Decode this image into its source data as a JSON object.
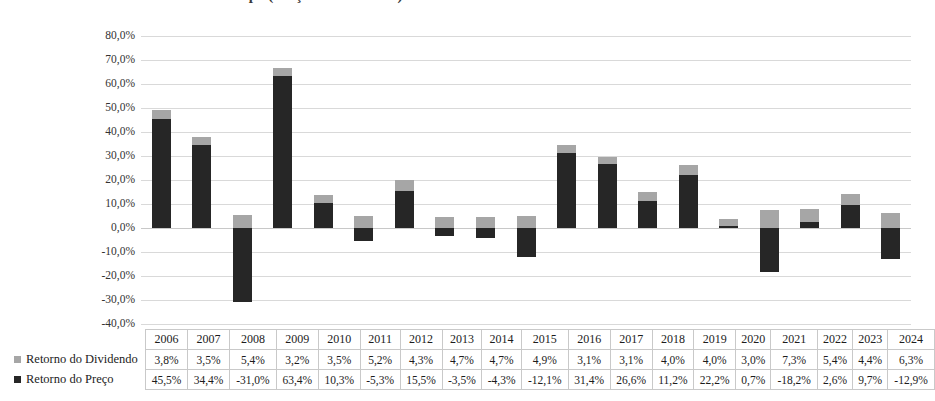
{
  "title": "Retorno Total do Ibovespa (Preço + Dividendos)",
  "legend": {
    "dividend_label": "Retorno do Dividendo",
    "price_label": "Retorno do Preço",
    "dividend_color": "#a6a6a6",
    "price_color": "#262626"
  },
  "axis": {
    "tick_labels": [
      "80,0%",
      "70,0%",
      "60,0%",
      "50,0%",
      "40,0%",
      "30,0%",
      "20,0%",
      "10,0%",
      "0,0%",
      "-10,0%",
      "-20,0%",
      "-30,0%",
      "-40,0%"
    ],
    "tick_values": [
      80,
      70,
      60,
      50,
      40,
      30,
      20,
      10,
      0,
      -10,
      -20,
      -30,
      -40
    ]
  },
  "table": {
    "year_header": [
      "2006",
      "2007",
      "2008",
      "2009",
      "2010",
      "2011",
      "2012",
      "2013",
      "2014",
      "2015",
      "2016",
      "2017",
      "2018",
      "2019",
      "2020",
      "2021",
      "2022",
      "2023",
      "2024"
    ],
    "dividend_row": [
      "3,8%",
      "3,5%",
      "5,4%",
      "3,2%",
      "3,5%",
      "5,2%",
      "4,3%",
      "4,7%",
      "4,7%",
      "4,9%",
      "3,1%",
      "3,1%",
      "4,0%",
      "4,0%",
      "3,0%",
      "7,3%",
      "5,4%",
      "4,4%",
      "6,3%"
    ],
    "price_row": [
      "45,5%",
      "34,4%",
      "-31,0%",
      "63,4%",
      "10,3%",
      "-5,3%",
      "15,5%",
      "-3,5%",
      "-4,3%",
      "-12,1%",
      "31,4%",
      "26,6%",
      "11,2%",
      "22,2%",
      "0,7%",
      "-18,2%",
      "2,6%",
      "9,7%",
      "-12,9%"
    ]
  },
  "chart_data": {
    "type": "bar",
    "stacked": true,
    "title": "Retorno Total do Ibovespa (Preço + Dividendos)",
    "xlabel": "",
    "ylabel": "",
    "ylim": [
      -40,
      80
    ],
    "ytick_step": 10,
    "grid": true,
    "legend_position": "table-row-headers",
    "categories": [
      "2006",
      "2007",
      "2008",
      "2009",
      "2010",
      "2011",
      "2012",
      "2013",
      "2014",
      "2015",
      "2016",
      "2017",
      "2018",
      "2019",
      "2020",
      "2021",
      "2022",
      "2023",
      "2024"
    ],
    "series": [
      {
        "name": "Retorno do Preço",
        "color": "#262626",
        "values": [
          45.5,
          34.4,
          -31.0,
          63.4,
          10.3,
          -5.3,
          15.5,
          -3.5,
          -4.3,
          -12.1,
          31.4,
          26.6,
          11.2,
          22.2,
          0.7,
          -18.2,
          2.6,
          9.7,
          -12.9
        ]
      },
      {
        "name": "Retorno do Dividendo",
        "color": "#a6a6a6",
        "values": [
          3.8,
          3.5,
          5.4,
          3.2,
          3.5,
          5.2,
          4.3,
          4.7,
          4.7,
          4.9,
          3.1,
          3.1,
          4.0,
          4.0,
          3.0,
          7.3,
          5.4,
          4.4,
          6.3
        ]
      }
    ]
  }
}
